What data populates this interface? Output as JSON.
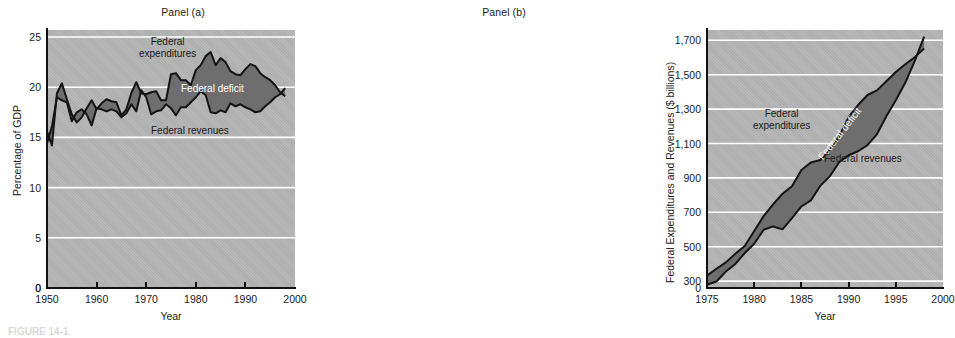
{
  "figure": {
    "caption": "FIGURE 14-1"
  },
  "panels": [
    {
      "id": "a",
      "title": "Panel (a)",
      "xlabel": "Year",
      "ylabel": "Percentage of GDP",
      "yticks": [
        "0",
        "5",
        "10",
        "15",
        "20",
        "25"
      ],
      "xticks": [
        "1950",
        "1960",
        "1970",
        "1980",
        "1990",
        "2000"
      ],
      "annotations": {
        "expenditures": "Federal\nexpenditures",
        "deficit": "Federal deficit",
        "revenues": "Federal revenues"
      }
    },
    {
      "id": "b",
      "title": "Panel (b)",
      "xlabel": "Year",
      "ylabel": "Federal Expenditures and Revenues ($ billions)",
      "yticks": [
        "0",
        "300",
        "500",
        "700",
        "900",
        "1,100",
        "1,300",
        "1,500",
        "1,700"
      ],
      "xticks": [
        "1975",
        "1980",
        "1985",
        "1990",
        "1995",
        "2000"
      ],
      "annotations": {
        "expenditures": "Federal\nexpenditures",
        "deficit": "Federal deficit",
        "revenues": "Federal revenues"
      }
    }
  ],
  "colors": {
    "plot_background": "#b4b4b4",
    "gridline": "#ffffff",
    "deficit_fill": "#6e6e6e",
    "line": "#141414",
    "axis": "#111111",
    "text": "#1a1a1a",
    "deficit_label": "#ffffff"
  },
  "chart_data": [
    {
      "type": "area",
      "title": "Panel (a)",
      "xlabel": "Year",
      "ylabel": "Percentage of GDP",
      "xlim": [
        1950,
        2000
      ],
      "ylim": [
        0,
        25.7
      ],
      "yticks": [
        0,
        5,
        10,
        15,
        20,
        25
      ],
      "xticks": [
        1950,
        1960,
        1970,
        1980,
        1990,
        2000
      ],
      "grid": true,
      "legend": "inline-annotations",
      "x": [
        1950,
        1951,
        1952,
        1953,
        1954,
        1955,
        1956,
        1957,
        1958,
        1959,
        1960,
        1961,
        1962,
        1963,
        1964,
        1965,
        1966,
        1967,
        1968,
        1969,
        1970,
        1971,
        1972,
        1973,
        1974,
        1975,
        1976,
        1977,
        1978,
        1979,
        1980,
        1981,
        1982,
        1983,
        1984,
        1985,
        1986,
        1987,
        1988,
        1989,
        1990,
        1991,
        1992,
        1993,
        1994,
        1995,
        1996,
        1997,
        1998
      ],
      "series": [
        {
          "name": "Federal expenditures",
          "values": [
            15.6,
            14.2,
            19.4,
            20.4,
            18.8,
            17.3,
            16.5,
            17.0,
            17.9,
            18.7,
            17.8,
            18.4,
            18.8,
            18.6,
            18.5,
            17.2,
            17.8,
            19.4,
            20.5,
            19.4,
            19.3,
            19.5,
            19.6,
            18.7,
            18.7,
            21.3,
            21.4,
            20.7,
            20.7,
            20.2,
            21.7,
            22.2,
            23.1,
            23.5,
            22.2,
            22.9,
            22.5,
            21.6,
            21.3,
            21.2,
            21.8,
            22.3,
            22.1,
            21.4,
            21.0,
            20.7,
            20.2,
            19.5,
            19.1
          ]
        },
        {
          "name": "Federal revenues",
          "values": [
            14.4,
            16.1,
            19.0,
            18.7,
            18.5,
            16.6,
            17.5,
            17.8,
            17.3,
            16.2,
            17.9,
            17.8,
            17.6,
            17.8,
            17.6,
            17.0,
            17.4,
            18.3,
            17.6,
            19.7,
            19.0,
            17.3,
            17.6,
            17.7,
            18.3,
            17.9,
            17.2,
            18.0,
            18.0,
            18.5,
            19.0,
            19.6,
            19.2,
            17.5,
            17.4,
            17.7,
            17.5,
            18.4,
            18.1,
            18.3,
            18.0,
            17.8,
            17.5,
            17.6,
            18.1,
            18.5,
            19.0,
            19.3,
            19.9
          ]
        }
      ],
      "fill_between": {
        "label": "Federal deficit",
        "upper": "Federal expenditures",
        "lower": "Federal revenues"
      }
    },
    {
      "type": "area",
      "title": "Panel (b)",
      "xlabel": "Year",
      "ylabel": "Federal Expenditures and Revenues ($ billions)",
      "xlim": [
        1975,
        2000
      ],
      "ylim": [
        260,
        1760
      ],
      "yticks": [
        300,
        500,
        700,
        900,
        1100,
        1300,
        1500,
        1700
      ],
      "ytick_labels": [
        "300",
        "500",
        "700",
        "900",
        "1,100",
        "1,300",
        "1,500",
        "1,700"
      ],
      "axis_break_below": 300,
      "xticks": [
        1975,
        1980,
        1985,
        1990,
        1995,
        2000
      ],
      "grid": true,
      "legend": "inline-annotations",
      "x": [
        1975,
        1976,
        1977,
        1978,
        1979,
        1980,
        1981,
        1982,
        1983,
        1984,
        1985,
        1986,
        1987,
        1988,
        1989,
        1990,
        1991,
        1992,
        1993,
        1994,
        1995,
        1996,
        1997,
        1998
      ],
      "series": [
        {
          "name": "Federal expenditures",
          "values": [
            332,
            372,
            409,
            459,
            504,
            591,
            678,
            746,
            808,
            852,
            946,
            990,
            1004,
            1064,
            1143,
            1253,
            1324,
            1382,
            1409,
            1462,
            1516,
            1561,
            1601,
            1653
          ]
        },
        {
          "name": "Federal revenues",
          "values": [
            279,
            298,
            356,
            400,
            463,
            517,
            599,
            618,
            601,
            666,
            734,
            769,
            854,
            909,
            991,
            1032,
            1055,
            1091,
            1154,
            1259,
            1352,
            1453,
            1579,
            1722
          ]
        }
      ],
      "fill_between": {
        "label": "Federal deficit",
        "upper": "Federal expenditures",
        "lower": "Federal revenues"
      }
    }
  ]
}
